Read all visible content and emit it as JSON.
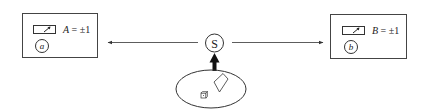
{
  "diagram": {
    "source": {
      "label": "S"
    },
    "detector_a": {
      "circle_label": "a",
      "equation_var": "A",
      "equation_rest": " = ±1"
    },
    "detector_b": {
      "circle_label": "b",
      "equation_var": "B",
      "equation_rest": " = ±1"
    },
    "arrows": [
      {
        "from": "S",
        "to": "detector_a",
        "direction": "left"
      },
      {
        "from": "S",
        "to": "detector_b",
        "direction": "right"
      },
      {
        "from": "control_ellipse",
        "to": "S",
        "direction": "up"
      }
    ],
    "control_ellipse": {
      "contents": [
        "cup-icon",
        "die-icon"
      ]
    },
    "colors": {
      "stroke": "#333333",
      "background": "#ffffff"
    }
  }
}
